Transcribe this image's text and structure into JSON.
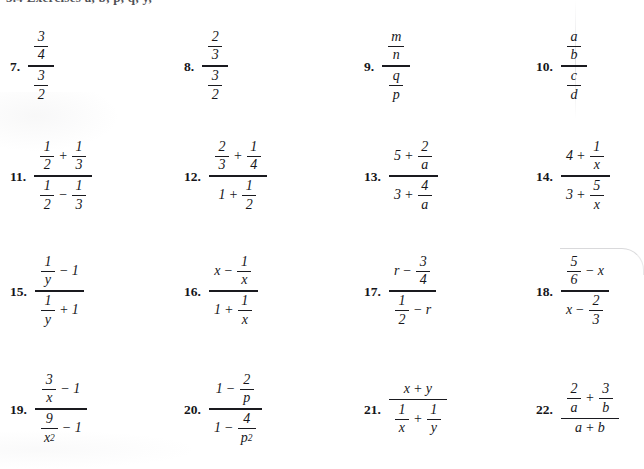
{
  "page": {
    "header_text_partial": "5.4 Exercises   a, b, p, q, y,",
    "background_color": "#ffffff",
    "ink_color": "#16161a"
  },
  "exercises": {
    "columns": 4,
    "rows": 4,
    "items": [
      {
        "number": "7.",
        "expr_text": "(3/4) / (3/2)"
      },
      {
        "number": "8.",
        "expr_text": "(2/3) / (3/2)"
      },
      {
        "number": "9.",
        "expr_text": "(m/n) / (q/p)"
      },
      {
        "number": "10.",
        "expr_text": "(a/b) / (c/d)"
      },
      {
        "number": "11.",
        "expr_text": "(1/2 + 1/3) / (1/2 - 1/3)"
      },
      {
        "number": "12.",
        "expr_text": "(2/3 + 1/4) / (1 + 1/2)"
      },
      {
        "number": "13.",
        "expr_text": "(5 + 2/a) / (3 + 4/a)"
      },
      {
        "number": "14.",
        "expr_text": "(4 + 1/x) / (3 + 5/x)"
      },
      {
        "number": "15.",
        "expr_text": "(1/y - 1) / (1/y + 1)"
      },
      {
        "number": "16.",
        "expr_text": "(x - 1/x) / (1 + 1/x)"
      },
      {
        "number": "17.",
        "expr_text": "(r - 3/4) / (1/2 - r)"
      },
      {
        "number": "18.",
        "expr_text": "(5/6 - x) / (x - 2/3)"
      },
      {
        "number": "19.",
        "expr_text": "(3/x - 1) / (9/x^2 - 1)"
      },
      {
        "number": "20.",
        "expr_text": "(1 - 2/p) / (1 - 4/p^2)"
      },
      {
        "number": "21.",
        "expr_text": "(x + y) / (1/x + 1/y)"
      },
      {
        "number": "22.",
        "expr_text": "(2/a + 3/b) / (a + b)"
      }
    ],
    "symbols": {
      "n7": {
        "num_num": "3",
        "num_den": "4",
        "den_num": "3",
        "den_den": "2"
      },
      "n8": {
        "num_num": "2",
        "num_den": "3",
        "den_num": "3",
        "den_den": "2"
      },
      "n9": {
        "num_num": "m",
        "num_den": "n",
        "den_num": "q",
        "den_den": "p"
      },
      "n10": {
        "num_num": "a",
        "num_den": "b",
        "den_num": "c",
        "den_den": "d"
      },
      "n11": {
        "a_num": "1",
        "a_den": "2",
        "op_top": "+",
        "b_num": "1",
        "b_den": "3",
        "c_num": "1",
        "c_den": "2",
        "op_bot": "−",
        "d_num": "1",
        "d_den": "3"
      },
      "n12": {
        "a_num": "2",
        "a_den": "3",
        "op_top": "+",
        "b_num": "1",
        "b_den": "4",
        "c_whole": "1",
        "op_bot": "+",
        "d_num": "1",
        "d_den": "2"
      },
      "n13": {
        "a_whole": "5",
        "op_top": "+",
        "b_num": "2",
        "b_den": "a",
        "c_whole": "3",
        "op_bot": "+",
        "d_num": "4",
        "d_den": "a"
      },
      "n14": {
        "a_whole": "4",
        "op_top": "+",
        "b_num": "1",
        "b_den": "x",
        "c_whole": "3",
        "op_bot": "+",
        "d_num": "5",
        "d_den": "x"
      },
      "n15": {
        "a_num": "1",
        "a_den": "y",
        "op_top": "−",
        "b_whole": "1",
        "c_num": "1",
        "c_den": "y",
        "op_bot": "+",
        "d_whole": "1"
      },
      "n16": {
        "a_whole": "x",
        "op_top": "−",
        "b_num": "1",
        "b_den": "x",
        "c_whole": "1",
        "op_bot": "+",
        "d_num": "1",
        "d_den": "x"
      },
      "n17": {
        "a_whole": "r",
        "op_top": "−",
        "b_num": "3",
        "b_den": "4",
        "c_num": "1",
        "c_den": "2",
        "op_bot": "−",
        "d_whole": "r"
      },
      "n18": {
        "a_num": "5",
        "a_den": "6",
        "op_top": "−",
        "b_whole": "x",
        "c_whole": "x",
        "op_bot": "−",
        "d_num": "2",
        "d_den": "3"
      },
      "n19": {
        "a_num": "3",
        "a_den": "x",
        "op_top": "−",
        "b_whole": "1",
        "c_num": "9",
        "c_den": "x",
        "c_den_exp": "2",
        "op_bot": "−",
        "d_whole": "1"
      },
      "n20": {
        "a_whole": "1",
        "op_top": "−",
        "b_num": "2",
        "b_den": "p",
        "c_whole": "1",
        "op_bot": "−",
        "d_num": "4",
        "d_den": "p",
        "d_den_exp": "2"
      },
      "n21": {
        "top_left": "x",
        "op_top": "+",
        "top_right": "y",
        "c_num": "1",
        "c_den": "x",
        "op_bot": "+",
        "d_num": "1",
        "d_den": "y"
      },
      "n22": {
        "a_num": "2",
        "a_den": "a",
        "op_top": "+",
        "b_num": "3",
        "b_den": "b",
        "bot_left": "a",
        "op_bot": "+",
        "bot_right": "b"
      }
    }
  }
}
